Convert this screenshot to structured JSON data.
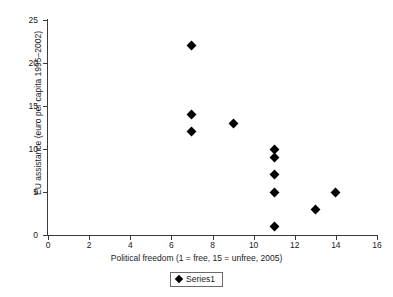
{
  "chart_data": {
    "type": "scatter",
    "title": "",
    "xlabel": "Political freedom (1 = free, 15 = unfree, 2005)",
    "ylabel": "EU assistance (euro per capita 1995–2002)",
    "xlim": [
      0,
      16
    ],
    "ylim": [
      0,
      25
    ],
    "xticks": [
      0,
      2,
      4,
      6,
      8,
      10,
      12,
      14,
      16
    ],
    "yticks": [
      0,
      5,
      10,
      15,
      20,
      25
    ],
    "grid": false,
    "legend_position": "bottom",
    "series": [
      {
        "name": "Series1",
        "marker": "diamond",
        "color": "#000000",
        "points": [
          {
            "x": 7,
            "y": 22
          },
          {
            "x": 7,
            "y": 14
          },
          {
            "x": 7,
            "y": 12
          },
          {
            "x": 9,
            "y": 13
          },
          {
            "x": 11,
            "y": 10
          },
          {
            "x": 11,
            "y": 9
          },
          {
            "x": 11,
            "y": 7
          },
          {
            "x": 11,
            "y": 5
          },
          {
            "x": 11,
            "y": 1
          },
          {
            "x": 13,
            "y": 3
          },
          {
            "x": 14,
            "y": 5
          }
        ]
      }
    ]
  },
  "legend": {
    "entries": [
      "Series1"
    ]
  }
}
